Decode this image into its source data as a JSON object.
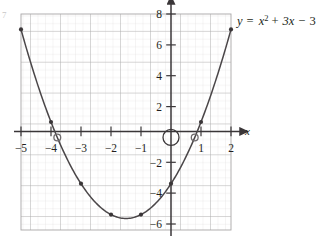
{
  "figure": {
    "corner_tag": "7",
    "equation_label": "y = x² + 3x − 3",
    "equation_parts": {
      "lhs": "y",
      "eq": "=",
      "term1_base": "x",
      "term1_exp": "2",
      "plus": "+",
      "term2": "3x",
      "minus": "−",
      "term3": "3"
    }
  },
  "chart_data": {
    "type": "line",
    "xlabel": "x",
    "ylabel": "y",
    "xlim": [
      -5,
      2
    ],
    "ylim": [
      -6,
      8
    ],
    "grid": true,
    "minor_grid_divisions": 4,
    "x_ticks": [
      -5,
      -4,
      -3,
      -2,
      -1,
      1,
      2
    ],
    "x_tick_labels": [
      "−5",
      "−4",
      "−3",
      "−2",
      "−1",
      "1",
      "2"
    ],
    "y_ticks": [
      8,
      6,
      4,
      2,
      -2,
      -4,
      -6
    ],
    "y_tick_labels": [
      "8",
      "6",
      "4",
      "2",
      "−2",
      "−4",
      "−6"
    ],
    "legend_position": "top-right",
    "series": [
      {
        "name": "y = x² + 3x − 3",
        "kind": "parabola",
        "coefficients": {
          "a": 1,
          "b": 3,
          "c": -3
        },
        "vertex": {
          "x": -1.5,
          "y": -5.25
        },
        "points": [
          {
            "x": -5,
            "y": 7
          },
          {
            "x": -4,
            "y": 1
          },
          {
            "x": -3,
            "y": -3
          },
          {
            "x": -2,
            "y": -5
          },
          {
            "x": -1,
            "y": -5
          },
          {
            "x": 0,
            "y": -3
          },
          {
            "x": 1,
            "y": 1
          },
          {
            "x": 2,
            "y": 7
          }
        ]
      }
    ],
    "annotations": {
      "roots_open_markers": [
        {
          "x": -3.79,
          "y": 0
        },
        {
          "x": 0.79,
          "y": 0
        }
      ],
      "origin_circle": {
        "x": 0,
        "y": 0
      }
    }
  }
}
